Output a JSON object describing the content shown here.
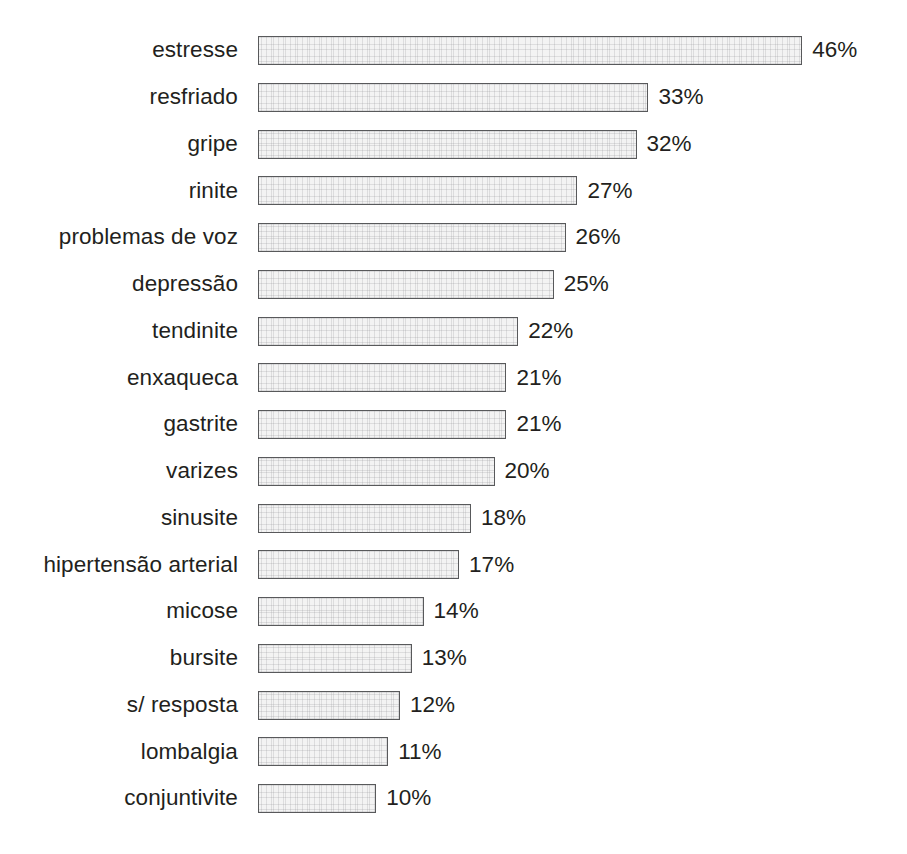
{
  "chart_data": {
    "type": "bar",
    "orientation": "horizontal",
    "title": "",
    "subtitle": "",
    "xlabel": "",
    "ylabel": "",
    "grid": false,
    "legend": null,
    "axis_visible": false,
    "value_suffix": "%",
    "xlim": [
      0,
      46
    ],
    "categories": [
      "estresse",
      "resfriado",
      "gripe",
      "rinite",
      "problemas de voz",
      "depressão",
      "tendinite",
      "enxaqueca",
      "gastrite",
      "varizes",
      "sinusite",
      "hipertensão arterial",
      "micose",
      "bursite",
      "s/ resposta",
      "lombalgia",
      "conjuntivite"
    ],
    "values": [
      46,
      33,
      32,
      27,
      26,
      25,
      22,
      21,
      21,
      20,
      18,
      17,
      14,
      13,
      12,
      11,
      10
    ],
    "value_labels": [
      "46%",
      "33%",
      "32%",
      "27%",
      "26%",
      "25%",
      "22%",
      "21%",
      "21%",
      "20%",
      "18%",
      "17%",
      "14%",
      "13%",
      "12%",
      "11%",
      "10%"
    ],
    "colors": {
      "bar_fill": "#f3f3f3",
      "bar_border": "#58595b",
      "text": "#231f20",
      "background": "#ffffff"
    }
  }
}
